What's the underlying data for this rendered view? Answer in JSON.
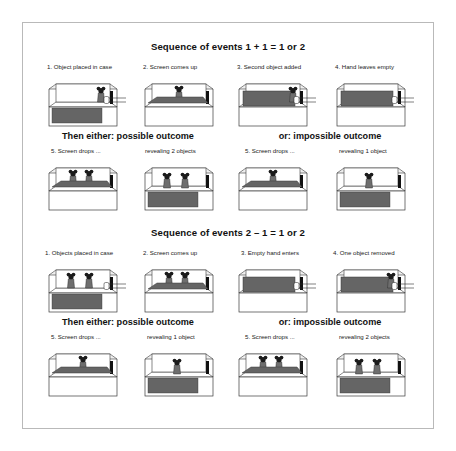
{
  "figure": {
    "sections": [
      {
        "id": "addition",
        "title": "Sequence of events 1 + 1 = 1 or 2",
        "steps": [
          {
            "label": "1. Object placed in case",
            "scene": "one-object-hand"
          },
          {
            "label": "2. Screen comes up",
            "scene": "screen-rising-one"
          },
          {
            "label": "3. Second object added",
            "scene": "screen-up-hand-object"
          },
          {
            "label": "4. Hand leaves empty",
            "scene": "screen-up-hand-empty"
          }
        ],
        "outcomes": [
          {
            "heading": "Then either: possible outcome",
            "steps": [
              {
                "label": "5. Screen drops ...",
                "scene": "screen-dropping-two"
              },
              {
                "label": "revealing 2 objects",
                "scene": "two-objects"
              }
            ]
          },
          {
            "heading": "or: impossible outcome",
            "steps": [
              {
                "label": "5. Screen drops ...",
                "scene": "screen-dropping-one"
              },
              {
                "label": "revealing 1 object",
                "scene": "one-object"
              }
            ]
          }
        ]
      },
      {
        "id": "subtraction",
        "title": "Sequence of events 2 – 1 = 1 or 2",
        "steps": [
          {
            "label": "1. Objects placed in case",
            "scene": "two-objects-hand"
          },
          {
            "label": "2. Screen comes up",
            "scene": "screen-rising-two"
          },
          {
            "label": "3. Empty hand enters",
            "scene": "screen-up-hand-empty"
          },
          {
            "label": "4. One object removed",
            "scene": "screen-up-hand-object"
          }
        ],
        "outcomes": [
          {
            "heading": "Then either: possible outcome",
            "steps": [
              {
                "label": "5. Screen drops ...",
                "scene": "screen-dropping-one"
              },
              {
                "label": "revealing 1 object",
                "scene": "one-object"
              }
            ]
          },
          {
            "heading": "or: impossible outcome",
            "steps": [
              {
                "label": "5. Screen drops ...",
                "scene": "screen-dropping-two"
              },
              {
                "label": "revealing 2 objects",
                "scene": "two-objects"
              }
            ]
          }
        ]
      }
    ],
    "colors": {
      "screen_fill": "#656565",
      "object_fill": "#6e6e6e",
      "object_head": "#1b1b1b",
      "case_line": "#3a3a3a",
      "case_shade": "#efefef",
      "frame_border": "#b9b9b9",
      "text": "#1a1a1a"
    }
  }
}
